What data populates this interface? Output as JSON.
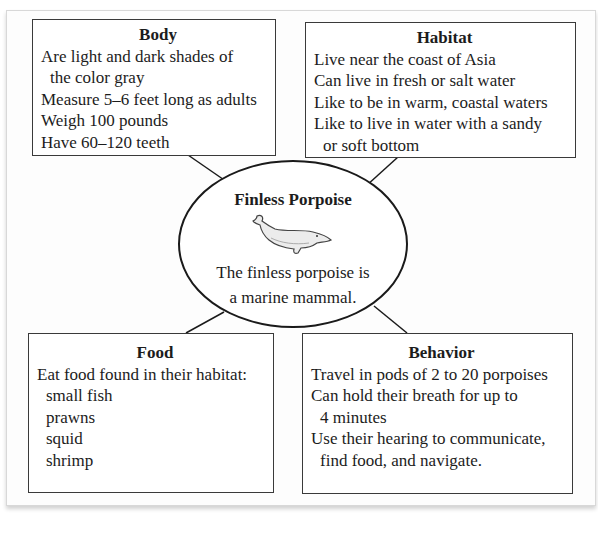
{
  "diagram": {
    "type": "concept-web",
    "center": {
      "title": "Finless Porpoise",
      "image": "porpoise-illustration",
      "caption_lines": [
        "The finless porpoise is",
        "a marine mammal."
      ]
    },
    "boxes": {
      "body": {
        "title": "Body",
        "lines": [
          {
            "text": "Are light and dark shades of",
            "indent": false
          },
          {
            "text": "the color gray",
            "indent": true
          },
          {
            "text": "Measure 5–6 feet long as adults",
            "indent": false
          },
          {
            "text": "Weigh 100 pounds",
            "indent": false
          },
          {
            "text": "Have 60–120 teeth",
            "indent": false
          }
        ]
      },
      "habitat": {
        "title": "Habitat",
        "lines": [
          {
            "text": "Live near the coast of Asia",
            "indent": false
          },
          {
            "text": "Can live in fresh or salt water",
            "indent": false
          },
          {
            "text": "Like to be in warm, coastal waters",
            "indent": false
          },
          {
            "text": "Like to live in water with a sandy",
            "indent": false
          },
          {
            "text": "or soft bottom",
            "indent": true
          }
        ]
      },
      "food": {
        "title": "Food",
        "lines": [
          {
            "text": "Eat food found in their habitat:",
            "indent": false
          },
          {
            "text": "small fish",
            "indent": true
          },
          {
            "text": "prawns",
            "indent": true
          },
          {
            "text": "squid",
            "indent": true
          },
          {
            "text": "shrimp",
            "indent": true
          }
        ]
      },
      "behavior": {
        "title": "Behavior",
        "lines": [
          {
            "text": "Travel in pods of 2 to 20 porpoises",
            "indent": false
          },
          {
            "text": "Can hold their breath for up to",
            "indent": false
          },
          {
            "text": "4 minutes",
            "indent": true
          },
          {
            "text": "Use their hearing to communicate,",
            "indent": false
          },
          {
            "text": "find food, and navigate.",
            "indent": true
          }
        ]
      }
    },
    "colors": {
      "border": "#3a3a3a",
      "text": "#1c1c1c",
      "background": "#ffffff"
    }
  }
}
